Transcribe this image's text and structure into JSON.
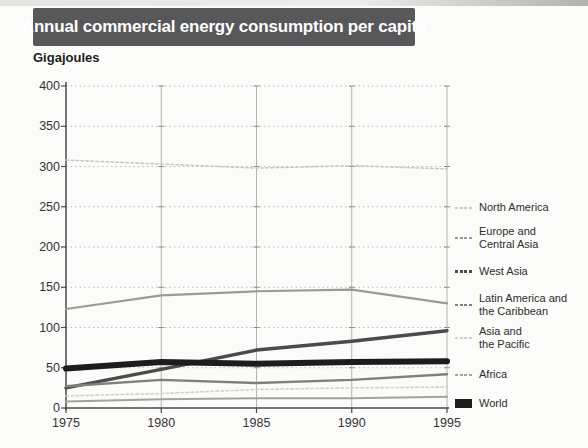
{
  "title": "Annual commercial energy consumption per capita",
  "unit_label": "Gigajoules",
  "colors": {
    "title_bar_bg": "#58585a",
    "title_text": "#ffffff",
    "axis": "#4a4a4a",
    "gridline": "#bababf",
    "page_bg": "#fbfbf9",
    "tick_label": "#333333",
    "world_line": "#1c1c1c"
  },
  "chart_data": {
    "type": "line",
    "title": "Annual commercial energy consumption per capita",
    "ylabel": "Gigajoules",
    "xlabel": "",
    "x": [
      1975,
      1980,
      1985,
      1990,
      1995
    ],
    "xtick_labels": [
      "1975",
      "1980",
      "1985",
      "1990",
      "1995"
    ],
    "yticks": [
      0,
      50,
      100,
      150,
      200,
      250,
      300,
      350,
      400
    ],
    "ylim": [
      0,
      400
    ],
    "xlim": [
      1975,
      1995
    ],
    "grid": true,
    "legend_position": "right",
    "series": [
      {
        "name": "North America",
        "label_lines": [
          "North America"
        ],
        "values": [
          308,
          303,
          298,
          301,
          297
        ],
        "color": "#c9c9c4",
        "line_width": 1.6,
        "dashed": true
      },
      {
        "name": "Europe and Central Asia",
        "label_lines": [
          "Europe and",
          "Central Asia"
        ],
        "values": [
          123,
          140,
          145,
          147,
          130
        ],
        "color": "#9b9b96",
        "line_width": 2.2,
        "dashed": false
      },
      {
        "name": "West Asia",
        "label_lines": [
          "West Asia"
        ],
        "values": [
          25,
          48,
          72,
          83,
          96
        ],
        "color": "#4b4b4b",
        "line_width": 3.4,
        "dashed": false
      },
      {
        "name": "Latin America and the Caribbean",
        "label_lines": [
          "Latin America and",
          "the Caribbean"
        ],
        "values": [
          27,
          35,
          31,
          35,
          42
        ],
        "color": "#80807b",
        "line_width": 2.4,
        "dashed": false
      },
      {
        "name": "Asia and the Pacific",
        "label_lines": [
          "Asia and",
          "the Pacific"
        ],
        "values": [
          15,
          18,
          23,
          25,
          26
        ],
        "color": "#d2d2cc",
        "line_width": 1.6,
        "dashed": true
      },
      {
        "name": "Africa",
        "label_lines": [
          "Africa"
        ],
        "values": [
          8,
          11,
          12,
          12,
          14
        ],
        "color": "#a3a39d",
        "line_width": 2,
        "dashed": false
      },
      {
        "name": "World",
        "label_lines": [
          "World"
        ],
        "values": [
          49,
          57,
          55,
          57,
          58
        ],
        "color": "#1c1c1c",
        "line_width": 6,
        "dashed": false
      }
    ]
  }
}
